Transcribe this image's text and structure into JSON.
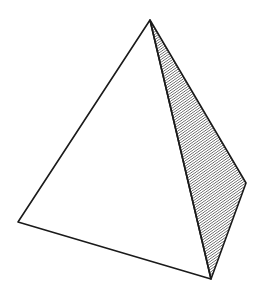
{
  "figure": {
    "vertices": {
      "apex": [
        150,
        20
      ],
      "left": [
        18,
        222
      ],
      "bottom": [
        211,
        279
      ],
      "right": [
        246,
        183
      ]
    },
    "colors": {
      "background": "#ffffff",
      "stroke": "#1a1a1a",
      "hatch": "#333333"
    },
    "shaded_face": "right"
  }
}
